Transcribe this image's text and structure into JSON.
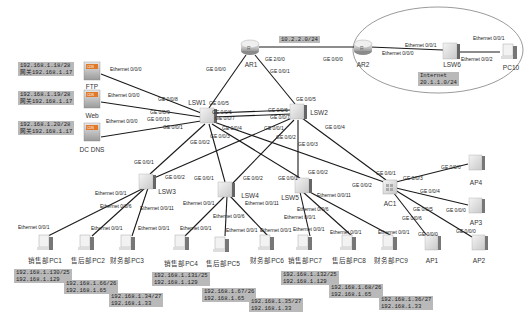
{
  "diagram": {
    "type": "network-topology",
    "routers": [
      {
        "id": "AR1",
        "label": "AR1",
        "x": 250,
        "y": 47
      },
      {
        "id": "AR2",
        "label": "AR2",
        "x": 363,
        "y": 47
      }
    ],
    "switches": [
      {
        "id": "LSW1",
        "label": "LSW1",
        "x": 207,
        "y": 115
      },
      {
        "id": "LSW2",
        "label": "LSW2",
        "x": 297,
        "y": 110
      },
      {
        "id": "LSW3",
        "label": "LSW3",
        "x": 146,
        "y": 180
      },
      {
        "id": "LSW4",
        "label": "LSW4",
        "x": 225,
        "y": 189
      },
      {
        "id": "LSW5",
        "label": "LSW5",
        "x": 302,
        "y": 185
      },
      {
        "id": "LSW6",
        "label": "LSW6",
        "x": 451,
        "y": 52
      }
    ],
    "ac": {
      "id": "AC1",
      "label": "AC1",
      "x": 390,
      "y": 186
    },
    "servers": [
      {
        "id": "FTP",
        "label": "FTP",
        "x": 92,
        "y": 70,
        "ip": "192.168.1.18/28",
        "gw": "网关192.168.1.17"
      },
      {
        "id": "Web",
        "label": "Web",
        "x": 92,
        "y": 97,
        "ip": "192.168.1.19/28",
        "gw": "网关192.168.1.17"
      },
      {
        "id": "DCDNS",
        "label": "DC DNS",
        "x": 92,
        "y": 130,
        "ip": "192.168.1.20/28",
        "gw": "网关192.168.1.17"
      }
    ],
    "aps": [
      {
        "id": "AP4",
        "label": "AP4",
        "x": 476,
        "y": 164
      },
      {
        "id": "AP3",
        "label": "AP3",
        "x": 476,
        "y": 208
      },
      {
        "id": "AP1",
        "label": "AP1",
        "x": 431,
        "y": 243
      },
      {
        "id": "AP2",
        "label": "AP2",
        "x": 478,
        "y": 243
      }
    ],
    "pcs": [
      {
        "id": "PC1",
        "label": "销售部PC1",
        "x": 45,
        "y": 243,
        "ip": "192.168.1.130/25",
        "gw": "192.168.1.129"
      },
      {
        "id": "PC2",
        "label": "售后部PC2",
        "x": 86,
        "y": 243,
        "ip": "192.168.1.66/26",
        "gw": "192.168.1.65"
      },
      {
        "id": "PC3",
        "label": "财务部PC3",
        "x": 127,
        "y": 243,
        "ip": "192.168.1.34/27",
        "gw": "192.168.1.33"
      },
      {
        "id": "PC4",
        "label": "销售部PC4",
        "x": 181,
        "y": 243,
        "ip": "192.168.1.131/25",
        "gw": "192.168.1.129"
      },
      {
        "id": "PC5",
        "label": "售后部PC5",
        "x": 221,
        "y": 245,
        "ip": "192.168.1.67/26",
        "gw": "192.168.1.65"
      },
      {
        "id": "PC6",
        "label": "财务部PC6",
        "x": 266,
        "y": 243,
        "ip": "192.168.1.35/27",
        "gw": "192.168.1.33"
      },
      {
        "id": "PC7",
        "label": "销售部PC7",
        "x": 304,
        "y": 243,
        "ip": "192.168.1.132/25",
        "gw": "192.168.1.129"
      },
      {
        "id": "PC8",
        "label": "售后部PC8",
        "x": 348,
        "y": 243,
        "ip": "192.168.1.68/26",
        "gw": "192.168.1.65"
      },
      {
        "id": "PC9",
        "label": "财务部PC9",
        "x": 389,
        "y": 243,
        "ip": "192.168.1.36/27",
        "gw": "192.168.1.33"
      },
      {
        "id": "PC10",
        "label": "PC10",
        "x": 509,
        "y": 52
      }
    ],
    "network_labels": [
      {
        "text": "10.2.2.0/24",
        "x": 288,
        "y": 40
      },
      {
        "text_line1": "Internet",
        "text_line2": "20.1.1.0/24",
        "x": 418,
        "y": 72
      }
    ],
    "links": [
      {
        "a": "AR1",
        "b": "AR2",
        "a_port": "GE 2/0/0",
        "b_port": "GE 0/0/0"
      },
      {
        "a": "AR1",
        "b": "LSW1",
        "a_port": "GE 0/0/0",
        "b_port": "GE 0/0/5"
      },
      {
        "a": "AR1",
        "b": "LSW2",
        "a_port": "GE 0/0/1",
        "b_port": "GE 0/0/5"
      },
      {
        "a": "LSW1",
        "b": "LSW2",
        "a_port": "GE 0/0/6",
        "b_port": "GE 0/0/6"
      },
      {
        "a": "LSW1",
        "b": "LSW2",
        "a_port": "GE 0/0/7",
        "b_port": "GE 0/0/7"
      },
      {
        "a": "FTP",
        "b": "LSW1",
        "a_port": "Ethernet 0/0/0",
        "b_port": "GE 0/0/8"
      },
      {
        "a": "Web",
        "b": "LSW1",
        "a_port": "Ethernet 0/0/0",
        "b_port": "GE 0/0/9"
      },
      {
        "a": "DCDNS",
        "b": "LSW1",
        "a_port": "Ethernet 0/0/0",
        "b_port": "GE 0/0/10"
      },
      {
        "a": "LSW1",
        "b": "LSW3",
        "a_port": "GE 0/0/1",
        "b_port": "GE 0/0/1"
      },
      {
        "a": "LSW1",
        "b": "LSW4",
        "a_port": "GE 0/0/2",
        "b_port": "GE 0/0/1"
      },
      {
        "a": "LSW1",
        "b": "LSW5",
        "a_port": "GE 0/0/3",
        "b_port": "GE 0/0/1"
      },
      {
        "a": "LSW1",
        "b": "AC1",
        "a_port": "GE 0/0/4",
        "b_port": "GE 0/0/1"
      },
      {
        "a": "LSW2",
        "b": "LSW3",
        "a_port": "GE 0/0/1",
        "b_port": "GE 0/0/2"
      },
      {
        "a": "LSW2",
        "b": "LSW4",
        "a_port": "GE 0/0/2",
        "b_port": "GE 0/0/2"
      },
      {
        "a": "LSW2",
        "b": "LSW5",
        "a_port": "GE 0/0/3",
        "b_port": "GE 0/0/2"
      },
      {
        "a": "LSW2",
        "b": "AC1",
        "a_port": "GE 0/0/4",
        "b_port": "GE 0/0/2"
      },
      {
        "a": "LSW3",
        "b": "PC1",
        "a_port": "Ethernet 0/0/1",
        "b_port": "Ethernet 0/0/1"
      },
      {
        "a": "LSW3",
        "b": "PC2",
        "a_port": "Ethernet 0/0/6",
        "b_port": "Ethernet 0/0/1"
      },
      {
        "a": "LSW3",
        "b": "PC3",
        "a_port": "Ethernet 0/0/11",
        "b_port": "Ethernet 0/0/1"
      },
      {
        "a": "LSW4",
        "b": "PC4",
        "a_port": "Ethernet 0/0/1",
        "b_port": "Ethernet 0/0/1"
      },
      {
        "a": "LSW4",
        "b": "PC5",
        "a_port": "Ethernet 0/0/6",
        "b_port": "Ethernet 0/0/1"
      },
      {
        "a": "LSW4",
        "b": "PC6",
        "a_port": "Ethernet 0/0/11",
        "b_port": "Ethernet 0/0/1"
      },
      {
        "a": "LSW5",
        "b": "PC7",
        "a_port": "Ethernet 0/0/1",
        "b_port": "Ethernet 0/0/1"
      },
      {
        "a": "LSW5",
        "b": "PC8",
        "a_port": "Ethernet 0/0/6",
        "b_port": "Ethernet 0/0/1"
      },
      {
        "a": "LSW5",
        "b": "PC9",
        "a_port": "Ethernet 0/0/11",
        "b_port": "Ethernet 0/0/1"
      },
      {
        "a": "AC1",
        "b": "AP4",
        "a_port": "GE 0/0/3",
        "b_port": "GE 0/0/0"
      },
      {
        "a": "AC1",
        "b": "AP3",
        "a_port": "GE 0/0/4",
        "b_port": "GE 0/0/0"
      },
      {
        "a": "AC1",
        "b": "AP1",
        "a_port": "GE 0/0/6",
        "b_port": "GE 0/0/0"
      },
      {
        "a": "AC1",
        "b": "AP2",
        "a_port": "GE 0/0/5",
        "b_port": "GE 0/0/0"
      },
      {
        "a": "AR2",
        "b": "LSW6",
        "a_port": "Ethernet 0/0/0",
        "b_port": "Ethernet 0/0/1"
      },
      {
        "a": "LSW6",
        "b": "PC10",
        "a_port": "Ethernet 0/0/2",
        "b_port": "Ethernet 0/0/1"
      }
    ]
  },
  "labels": {
    "net_10": "10.2.2.0/24",
    "internet_l1": "Internet",
    "internet_l2": "20.1.1.0/24",
    "ftp_ip": "192.168.1.18/28",
    "ftp_gw": "网关192.168.1.17",
    "web_ip": "192.168.1.19/28",
    "web_gw": "网关192.168.1.17",
    "dns_ip": "192.168.1.20/28",
    "dns_gw": "网关192.168.1.17",
    "pc1_ip": "192.168.1.130/25",
    "pc1_gw": "192.168.1.129",
    "pc2_ip": "192.168.1.66/26",
    "pc2_gw": "192.168.1.65",
    "pc3_ip": "192.168.1.34/27",
    "pc3_gw": "192.168.1.33",
    "pc4_ip": "192.168.1.131/25",
    "pc4_gw": "192.168.1.129",
    "pc5_ip": "192.168.1.67/26",
    "pc5_gw": "192.168.1.65",
    "pc6_ip": "192.168.1.35/27",
    "pc6_gw": "192.168.1.33",
    "pc7_ip": "192.168.1.132/25",
    "pc7_gw": "192.168.1.129",
    "pc8_ip": "192.168.1.68/26",
    "pc8_gw": "192.168.1.65",
    "pc9_ip": "192.168.1.36/27",
    "pc9_gw": "192.168.1.33",
    "n_ar1": "AR1",
    "n_ar2": "AR2",
    "n_lsw1": "LSW1",
    "n_lsw2": "LSW2",
    "n_lsw3": "LSW3",
    "n_lsw4": "LSW4",
    "n_lsw5": "LSW5",
    "n_lsw6": "LSW6",
    "n_ac1": "AC1",
    "n_ap1": "AP1",
    "n_ap2": "AP2",
    "n_ap3": "AP3",
    "n_ap4": "AP4",
    "n_ftp": "FTP",
    "n_web": "Web",
    "n_dns": "DC DNS",
    "n_pc10": "PC10",
    "n_pc1": "销售部PC1",
    "n_pc2": "售后部PC2",
    "n_pc3": "财务部PC3",
    "n_pc4": "销售部PC4",
    "n_pc5": "售后部PC5",
    "n_pc6": "财务部PC6",
    "n_pc7": "销售部PC7",
    "n_pc8": "售后部PC8",
    "n_pc9": "财务部PC9",
    "ge000": "GE 0/0/0",
    "ge001": "GE 0/0/1",
    "ge002": "GE 0/0/2",
    "ge003": "GE 0/0/3",
    "ge004": "GE 0/0/4",
    "ge005": "GE 0/0/5",
    "ge006": "GE 0/0/6",
    "ge007": "GE 0/0/7",
    "ge008": "GE 0/0/8",
    "ge009": "GE 0/0/9",
    "ge0010": "GE 0/0/10",
    "ge200": "GE 2/0/0",
    "eth000": "Ethernet 0/0/0",
    "eth001": "Ethernet 0/0/1",
    "eth002": "Ethernet 0/0/2",
    "eth006": "Ethernet 0/0/6",
    "eth0011": "Ethernet 0/0/11"
  },
  "colors": {
    "link": "#1a1a1a",
    "ip_box_bg": "#b9b9b9",
    "server_orange": "#e07a2a",
    "device_gray": "#d9d9d9"
  }
}
